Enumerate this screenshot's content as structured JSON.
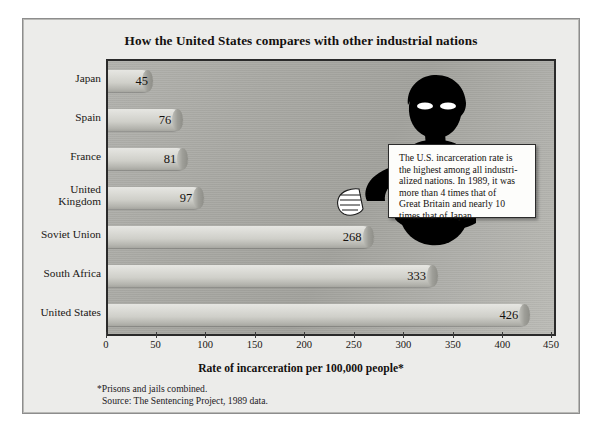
{
  "chart_data": {
    "type": "bar",
    "orientation": "horizontal",
    "title": "How the United States compares with other industrial nations",
    "xlabel": "Rate of incarceration per 100,000 people*",
    "ylabel": "",
    "xlim": [
      0,
      450
    ],
    "xticks": [
      0,
      50,
      100,
      150,
      200,
      250,
      300,
      350,
      400,
      450
    ],
    "grid": false,
    "legend": null,
    "categories": [
      "Japan",
      "Spain",
      "France",
      "United Kingdom",
      "Soviet Union",
      "South Africa",
      "United States"
    ],
    "values": [
      45,
      76,
      81,
      97,
      268,
      333,
      426
    ],
    "annotations": [
      "The U.S. incarceration rate is the highest among all industrialized nations. In 1989, it was more than 4 times that of Great Britain and nearly 10 times that of Japan."
    ],
    "footnotes": [
      "*Prisons and jails combined.",
      "Source: The Sentencing Project, 1989 data."
    ]
  },
  "title": "How the United States compares with other industrial nations",
  "axis": {
    "x_title": "Rate of incarceration per 100,000 people*",
    "ticks": [
      "0",
      "50",
      "100",
      "150",
      "200",
      "250",
      "300",
      "350",
      "400",
      "450"
    ]
  },
  "bars": [
    {
      "label": "Japan",
      "label_line1": "Japan",
      "label_line2": "",
      "value": 45,
      "value_text": "45"
    },
    {
      "label": "Spain",
      "label_line1": "Spain",
      "label_line2": "",
      "value": 76,
      "value_text": "76"
    },
    {
      "label": "France",
      "label_line1": "France",
      "label_line2": "",
      "value": 81,
      "value_text": "81"
    },
    {
      "label": "United Kingdom",
      "label_line1": "United",
      "label_line2": "Kingdom",
      "value": 97,
      "value_text": "97"
    },
    {
      "label": "Soviet Union",
      "label_line1": "Soviet Union",
      "label_line2": "",
      "value": 268,
      "value_text": "268"
    },
    {
      "label": "South Africa",
      "label_line1": "South Africa",
      "label_line2": "",
      "value": 333,
      "value_text": "333"
    },
    {
      "label": "United States",
      "label_line1": "United States",
      "label_line2": "",
      "value": 426,
      "value_text": "426"
    }
  ],
  "callout": {
    "line1": "The U.S. incarceration rate is",
    "line2": "the highest among all industri-",
    "line3": "alized nations. In 1989, it was",
    "line4": "more than 4 times that of",
    "line5": "Great Britain and nearly 10",
    "line6": "times that of Japan."
  },
  "footnotes": {
    "line1": "*Prisons and jails combined.",
    "line2": "Source: The Sentencing Project, 1989 data."
  },
  "colors": {
    "page_background": "#ffffff",
    "panel_background": "#ececea",
    "plot_background": "#a9a9a4",
    "bar_fill": "#dcdcd7",
    "bar_cap": "#9e9e98",
    "figure_silhouette": "#000000",
    "callout_background": "#fdfdfb",
    "text": "#15120f"
  }
}
